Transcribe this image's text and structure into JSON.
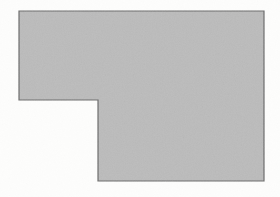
{
  "figure": {
    "description": "A solid light-gray L-shaped hexagon (a rectangle with a rectangular notch removed from its lower-left corner) outlined with a thin dark gray line on an off-white paper background.",
    "canvas": {
      "width": 280,
      "height": 197,
      "background_color": "#fdfdfc"
    },
    "shape": {
      "name": "l-shape-polygon",
      "type": "polygon",
      "sides": 6,
      "fill_color": "#bcbcbc",
      "stroke_color": "#6a6a6a",
      "stroke_width": 1.2,
      "points": [
        {
          "label": "top-left",
          "x": 19,
          "y": 11
        },
        {
          "label": "top-right",
          "x": 264,
          "y": 11
        },
        {
          "label": "bottom-right",
          "x": 264,
          "y": 181
        },
        {
          "label": "bottom-left",
          "x": 98,
          "y": 181
        },
        {
          "label": "notch-inner-corner",
          "x": 98,
          "y": 100
        },
        {
          "label": "notch-left",
          "x": 19,
          "y": 100
        }
      ],
      "points_path": "19,11 264,11 264,181 98,181 98,100 19,100",
      "bounding_box": {
        "x": 19,
        "y": 11,
        "width": 245,
        "height": 170
      },
      "notch": {
        "name": "lower-left-notch",
        "x": 19,
        "y": 100,
        "width": 79,
        "height": 81
      }
    },
    "grain": {
      "name": "paper-grain-texture",
      "opacity": 0.55,
      "base_frequency": 0.85,
      "octaves": 3
    }
  }
}
